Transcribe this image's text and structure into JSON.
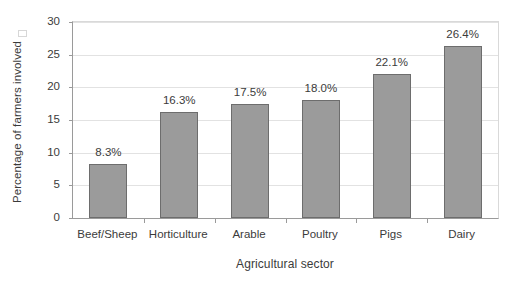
{
  "chart_data": {
    "type": "bar",
    "title": "",
    "xlabel": "Agricultural sector",
    "ylabel": "Percentage of farmers involved",
    "categories": [
      "Beef/Sheep",
      "Horticulture",
      "Arable",
      "Poultry",
      "Pigs",
      "Dairy"
    ],
    "values": [
      8.3,
      16.3,
      17.5,
      18.0,
      22.1,
      26.4
    ],
    "data_labels": [
      "8.3%",
      "16.3%",
      "17.5%",
      "18.0%",
      "22.1%",
      "26.4%"
    ],
    "ylim": [
      0,
      30
    ],
    "ytick_labels": [
      "0",
      "5",
      "10",
      "15",
      "20",
      "25",
      "30"
    ],
    "ytick_values": [
      0,
      5,
      10,
      15,
      20,
      25,
      30
    ],
    "grid": "horizontal",
    "legend": "none",
    "bar_fill_color": "#9b9b9b",
    "bar_border_color": "#6d6d6d",
    "gridline_color": "#e2e2e2",
    "axis_color": "#9a9a9a",
    "text_color": "#3b3b3b",
    "background_color": "#ffffff"
  }
}
